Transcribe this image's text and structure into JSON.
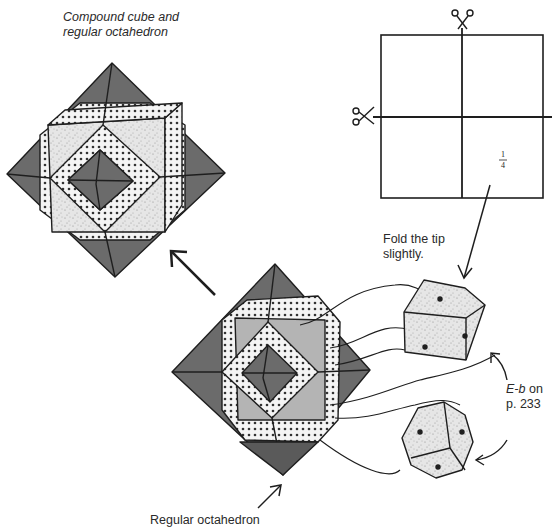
{
  "title": {
    "line1": "Compound cube and",
    "line2": "regular octahedron"
  },
  "square_sheet": {
    "fraction_numerator": "1",
    "fraction_denominator": "4",
    "cut_icons": [
      "scissors-icon-top",
      "scissors-icon-left"
    ]
  },
  "annotations": {
    "fold_tip_line1": "Fold the tip",
    "fold_tip_line2": "slightly.",
    "ref_italic": "E-b",
    "ref_on": " on",
    "ref_page": "p. 233",
    "bottom_label": "Regular octahedron"
  },
  "colors": {
    "dark_face": "#6b6b6b",
    "mid_face": "#b4b4b4",
    "texture_face": "#e3e3e3",
    "stroke": "#1e1e1e"
  }
}
